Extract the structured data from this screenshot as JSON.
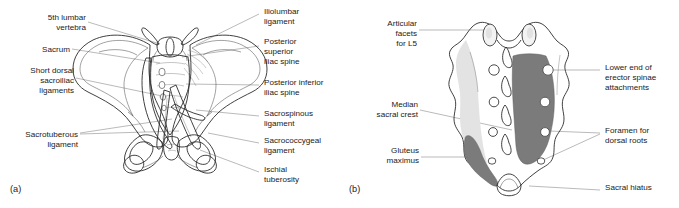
{
  "figure": {
    "background_color": "#ffffff",
    "text_color": "#1a1a1a",
    "leader_line_color": "#8c8c8c",
    "outline_color": "#2b2b2b"
  },
  "panels": [
    {
      "id": "a",
      "letter": "(a)",
      "caption": "Posterior view of the bony pelvis with ligaments",
      "fill_light": "#ebebeb",
      "fill_mid": "#dcdcdc",
      "fill_shadow": "#c9c9c9",
      "labels_left": [
        {
          "name": "fifth-lumbar-vertebra",
          "lines": [
            "5th lumbar",
            "vertebra"
          ],
          "align": "right"
        },
        {
          "name": "sacrum",
          "lines": [
            "Sacrum"
          ],
          "align": "right"
        },
        {
          "name": "short-dorsal-sacroiliac-ligaments",
          "lines": [
            "Short dorsal",
            "sacroiliac",
            "ligaments"
          ],
          "align": "right"
        },
        {
          "name": "sacrotuberous-ligament",
          "lines": [
            "Sacrotuberous",
            "ligament"
          ],
          "align": "right"
        }
      ],
      "labels_right": [
        {
          "name": "iliolumbar-ligament",
          "lines": [
            "Iliolumbar",
            "ligament"
          ],
          "align": "left"
        },
        {
          "name": "posterior-superior-iliac-spine",
          "lines": [
            "Posterior",
            "superior",
            "iliac spine"
          ],
          "align": "left"
        },
        {
          "name": "posterior-inferior-iliac-spine",
          "lines": [
            "Posterior inferior",
            "iliac spine"
          ],
          "align": "left"
        },
        {
          "name": "sacrospinous-ligament",
          "lines": [
            "Sacrospinous",
            "ligament"
          ],
          "align": "left"
        },
        {
          "name": "sacrococcygeal-ligament",
          "lines": [
            "Sacrococcygeal",
            "ligament"
          ],
          "align": "left"
        },
        {
          "name": "ischial-tuberosity",
          "lines": [
            "Ischial",
            "tuberosity"
          ],
          "align": "left"
        }
      ]
    },
    {
      "id": "b",
      "letter": "(b)",
      "caption": "Dorsal surface of the sacrum showing muscle attachments",
      "fill_light": "#ededed",
      "fill_mid": "#e2e2e2",
      "fill_dark": "#7b7b7b",
      "labels_left": [
        {
          "name": "articular-facets-for-l5",
          "lines": [
            "Articular",
            "facets",
            "for L5"
          ],
          "align": "right"
        },
        {
          "name": "median-sacral-crest",
          "lines": [
            "Median",
            "sacral crest"
          ],
          "align": "right"
        },
        {
          "name": "gluteus-maximus",
          "lines": [
            "Gluteus",
            "maximus"
          ],
          "align": "right"
        }
      ],
      "labels_right": [
        {
          "name": "lower-end-of-erector-spinae-attachments",
          "lines": [
            "Lower end of",
            "erector spinae",
            "attachments"
          ],
          "align": "left"
        },
        {
          "name": "foramen-for-dorsal-roots",
          "lines": [
            "Foramen for",
            "dorsal roots"
          ],
          "align": "left"
        },
        {
          "name": "sacral-hiatus",
          "lines": [
            "Sacral hiatus"
          ],
          "align": "left"
        }
      ]
    }
  ]
}
